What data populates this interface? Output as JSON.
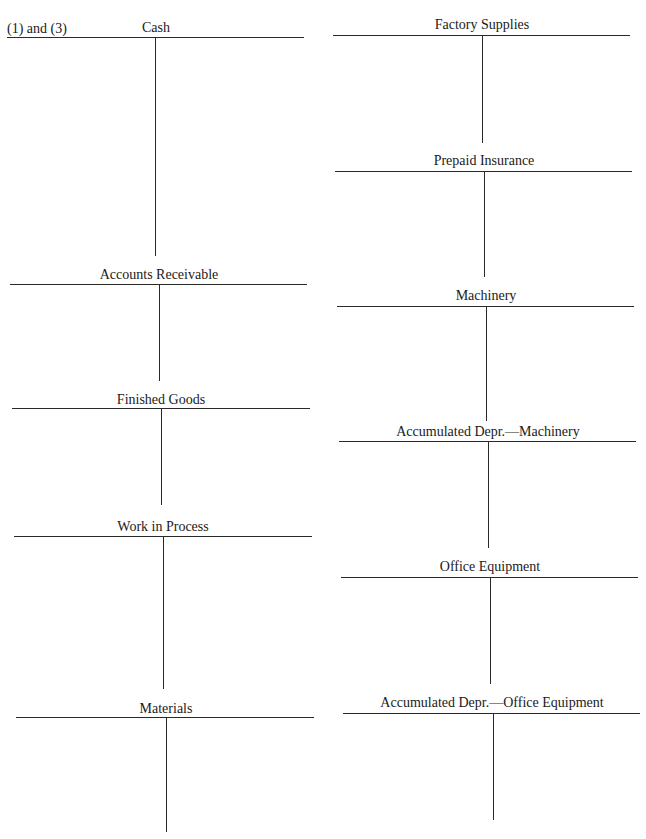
{
  "worksheet": {
    "part_label": "(1) and (3)",
    "left_column": [
      {
        "name": "Cash",
        "debits": [],
        "credits": []
      },
      {
        "name": "Accounts Receivable",
        "debits": [],
        "credits": []
      },
      {
        "name": "Finished Goods",
        "debits": [],
        "credits": []
      },
      {
        "name": "Work in Process",
        "debits": [],
        "credits": []
      },
      {
        "name": "Materials",
        "debits": [],
        "credits": []
      }
    ],
    "right_column": [
      {
        "name": "Factory Supplies",
        "debits": [],
        "credits": []
      },
      {
        "name": "Prepaid Insurance",
        "debits": [],
        "credits": []
      },
      {
        "name": "Machinery",
        "debits": [],
        "credits": []
      },
      {
        "name": "Accumulated Depr.—Machinery",
        "debits": [],
        "credits": []
      },
      {
        "name": "Office Equipment",
        "debits": [],
        "credits": []
      },
      {
        "name": "Accumulated Depr.—Office Equipment",
        "debits": [],
        "credits": []
      }
    ]
  }
}
